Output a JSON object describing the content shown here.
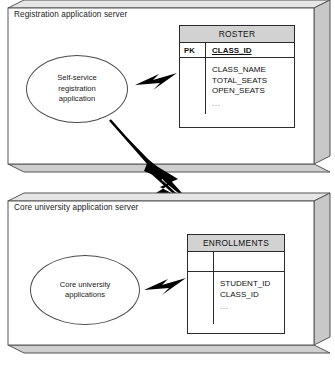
{
  "diagram": {
    "colors": {
      "box_fill": "#ffffff",
      "box_stroke": "#555555",
      "side_shade": "#c8c8c8",
      "bottom_shade": "#cfcfcf",
      "table_header_fill": "#d2d2d2",
      "table_stroke": "#2b2b2b",
      "bolt": "#000000",
      "text": "#111111"
    }
  },
  "servers": [
    {
      "id": "registration-server",
      "label": "Registration application server",
      "app": {
        "id": "self-service-registration-application",
        "lines": [
          "Self-service",
          "registration",
          "application"
        ]
      },
      "entity": {
        "id": "roster-entity",
        "name": "ROSTER",
        "key_label": "PK",
        "key_attribute": "CLASS_ID",
        "attributes": [
          "CLASS_NAME",
          "TOTAL_SEATS",
          "OPEN_SEATS"
        ],
        "ellipsis": "..."
      }
    },
    {
      "id": "core-university-server",
      "label": "Core university application server",
      "app": {
        "id": "core-university-applications",
        "lines": [
          "Core university",
          "applications"
        ]
      },
      "entity": {
        "id": "enrollments-entity",
        "name": "ENROLLMENTS",
        "key_label": "",
        "key_attribute": "",
        "attributes": [
          "STUDENT_ID",
          "CLASS_ID"
        ],
        "ellipsis": "..."
      }
    }
  ],
  "connectors": [
    {
      "id": "registration-app-to-roster",
      "type": "lightning-bolt",
      "size": "small"
    },
    {
      "id": "registration-app-to-enrollments",
      "type": "lightning-bolt",
      "size": "large-diagonal"
    },
    {
      "id": "core-app-to-enrollments",
      "type": "lightning-bolt",
      "size": "small"
    }
  ]
}
